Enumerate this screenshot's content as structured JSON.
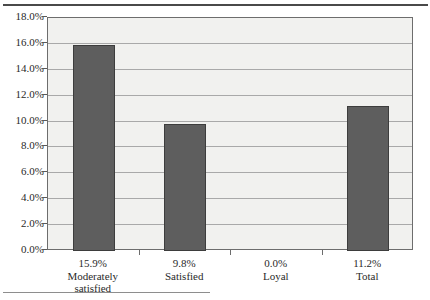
{
  "chart_data": {
    "type": "bar",
    "title": "",
    "subtitle": "",
    "xlabel": "",
    "ylabel": "",
    "categories": [
      "Moderately satisfied",
      "Satisfied",
      "Loyal",
      "Total"
    ],
    "category_lines": [
      [
        "15.9%",
        "Moderately",
        "satisfied"
      ],
      [
        "9.8%",
        "Satisfied"
      ],
      [
        "0.0%",
        "Loyal"
      ],
      [
        "11.2%",
        "Total"
      ]
    ],
    "values": [
      15.9,
      9.8,
      0.0,
      11.2
    ],
    "value_labels": [
      "15.9%",
      "9.8%",
      "0.0%",
      "11.2%"
    ],
    "ylim": [
      0,
      18
    ],
    "ytick_step": 2,
    "ytick_labels": [
      "18.0%",
      "16.0%",
      "14.0%",
      "12.0%",
      "10.0%",
      "8.0%",
      "6.0%",
      "4.0%",
      "2.0%",
      "0.0%"
    ],
    "ytick_values": [
      18,
      16,
      14,
      12,
      10,
      8,
      6,
      4,
      2,
      0
    ],
    "grid": true,
    "legend": "none",
    "colors": {
      "bar_fill": "#5e5e5e",
      "bar_border": "#3d3d3d",
      "plot_background": "#f1f1ef",
      "plot_border": "#6d6d6d",
      "gridline": "#a9a9a9",
      "text": "#2a2a2a",
      "rule": "#4a4a4a"
    }
  }
}
